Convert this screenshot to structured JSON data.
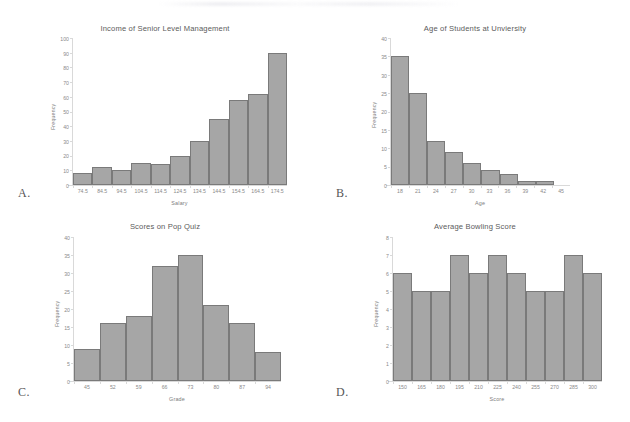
{
  "panels": [
    {
      "letter": "A."
    },
    {
      "letter": "B."
    },
    {
      "letter": "C."
    },
    {
      "letter": "D."
    }
  ],
  "chart_data": [
    {
      "type": "bar",
      "title": "Income of Senior Level Management",
      "xlabel": "Salary",
      "ylabel": "Frequency",
      "categories": [
        "74.5",
        "84.5",
        "94.5",
        "104.5",
        "114.5",
        "124.5",
        "134.5",
        "144.5",
        "154.5",
        "164.5",
        "174.5"
      ],
      "values": [
        8,
        12,
        10,
        15,
        14,
        20,
        30,
        45,
        58,
        62,
        90
      ],
      "yticks": [
        0,
        10,
        20,
        30,
        40,
        50,
        60,
        70,
        80,
        90,
        100
      ],
      "ylim": [
        0,
        100
      ],
      "grid": false,
      "legend": "none",
      "bar_color": "#a6a6a6",
      "bar_border_color": "#7a7a7a"
    },
    {
      "type": "bar",
      "title": "Age of Students at Unviersity",
      "xlabel": "Age",
      "ylabel": "Frequency",
      "categories": [
        "18",
        "21",
        "24",
        "27",
        "30",
        "33",
        "36",
        "39",
        "42",
        "45"
      ],
      "values": [
        35,
        25,
        12,
        9,
        6,
        4,
        3,
        1,
        1
      ],
      "yticks": [
        0,
        5,
        10,
        15,
        20,
        25,
        30,
        35,
        40
      ],
      "ylim": [
        0,
        40
      ],
      "grid": false,
      "legend": "none",
      "bar_color": "#a6a6a6",
      "bar_border_color": "#7a7a7a"
    },
    {
      "type": "bar",
      "title": "Scores on Pop Quiz",
      "xlabel": "Grade",
      "ylabel": "Frequency",
      "categories": [
        "45",
        "52",
        "59",
        "66",
        "73",
        "80",
        "87",
        "94"
      ],
      "values": [
        9,
        16,
        18,
        32,
        35,
        21,
        16,
        8
      ],
      "yticks": [
        0,
        5,
        10,
        15,
        20,
        25,
        30,
        35,
        40
      ],
      "ylim": [
        0,
        40
      ],
      "grid": false,
      "legend": "none",
      "bar_color": "#a6a6a6",
      "bar_border_color": "#7a7a7a"
    },
    {
      "type": "bar",
      "title": "Average Bowling Score",
      "xlabel": "Score",
      "ylabel": "Frequency",
      "categories": [
        "150",
        "165",
        "180",
        "195",
        "210",
        "225",
        "240",
        "255",
        "270",
        "285",
        "300"
      ],
      "values": [
        6,
        5,
        5,
        7,
        6,
        7,
        6,
        5,
        5,
        7,
        6
      ],
      "yticks": [
        0,
        1,
        2,
        3,
        4,
        5,
        6,
        7,
        8
      ],
      "ylim": [
        0,
        8
      ],
      "grid": false,
      "legend": "none",
      "bar_color": "#a6a6a6",
      "bar_border_color": "#7a7a7a"
    }
  ]
}
